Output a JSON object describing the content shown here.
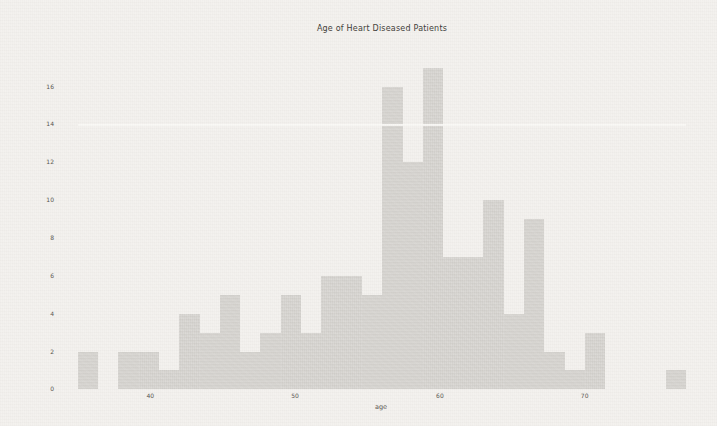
{
  "figure": {
    "title": "Age of Heart Diseased Patients",
    "xlabel": "age"
  },
  "chart_data": {
    "type": "bar",
    "subtype": "histogram",
    "title": "Age of Heart Diseased Patients",
    "xlabel": "age",
    "ylabel": "",
    "bin_edges": [
      35.0,
      36.4,
      37.8,
      39.2,
      40.6,
      42.0,
      43.4,
      44.8,
      46.2,
      47.6,
      49.0,
      50.4,
      51.8,
      53.2,
      54.6,
      56.0,
      57.4,
      58.8,
      60.2,
      61.6,
      63.0,
      64.4,
      65.8,
      67.2,
      68.6,
      70.0,
      71.4,
      72.8,
      74.2,
      75.6,
      77.0
    ],
    "counts": [
      2,
      0,
      2,
      2,
      1,
      4,
      3,
      5,
      2,
      3,
      5,
      3,
      6,
      6,
      5,
      16,
      12,
      17,
      7,
      7,
      10,
      4,
      9,
      2,
      1,
      3,
      0,
      0,
      0,
      1
    ],
    "x_ticks": [
      40,
      50,
      60,
      70
    ],
    "y_ticks": [
      0,
      2,
      4,
      6,
      8,
      10,
      12,
      14,
      16
    ],
    "xlim": [
      29.9,
      82.1
    ],
    "ylim": [
      0,
      17.85
    ],
    "grid": "white horizontal gridline visible at y=14 over tall bars",
    "legend": "none"
  },
  "annotations": {
    "white_gridline_value": 14
  },
  "colors": {
    "figure_background": "#f3f1ee",
    "bar_fill": "#d7d5d1",
    "title_text": "#3c3a36",
    "tick_text": "#55524d",
    "gridline": "#faf9f6"
  }
}
